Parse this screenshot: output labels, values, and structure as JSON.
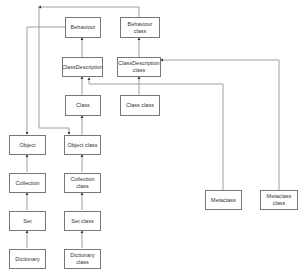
{
  "diagram": {
    "type": "class-hierarchy",
    "nodes": {
      "behaviour": "Behaviour",
      "behaviour_class": "Behaviour\nclass",
      "class_description": "ClassDescription",
      "class_description_class": "ClassDescription\nclass",
      "class": "Class",
      "class_class": "Class class",
      "object": "Object",
      "object_class": "Object class",
      "collection": "Collection",
      "collection_class": "Collection\nclass",
      "set": "Set",
      "set_class": "Set class",
      "dictionary": "Dictionary",
      "dictionary_class": "Dictionary\nclass",
      "metaclass": "Metaclass",
      "metaclass_class": "Metaclass\nclass"
    },
    "edges": [
      {
        "from": "ClassDescription",
        "to": "Behaviour"
      },
      {
        "from": "Class",
        "to": "ClassDescription"
      },
      {
        "from": "ClassDescription class",
        "to": "Behaviour class"
      },
      {
        "from": "Class class",
        "to": "ClassDescription class"
      },
      {
        "from": "Behaviour",
        "to": "Object"
      },
      {
        "from": "Behaviour class",
        "to": "Object class"
      },
      {
        "from": "Collection",
        "to": "Object"
      },
      {
        "from": "Set",
        "to": "Collection"
      },
      {
        "from": "Dictionary",
        "to": "Set"
      },
      {
        "from": "Object class",
        "to": "Class"
      },
      {
        "from": "Collection class",
        "to": "Object class"
      },
      {
        "from": "Set class",
        "to": "Collection class"
      },
      {
        "from": "Dictionary class",
        "to": "Set class"
      },
      {
        "from": "Metaclass",
        "to": "ClassDescription"
      },
      {
        "from": "Metaclass class",
        "to": "ClassDescription class"
      }
    ]
  }
}
